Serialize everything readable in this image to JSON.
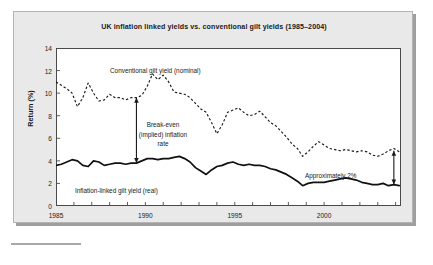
{
  "figure": {
    "title": "UK inflation linked yields vs. conventional gilt yields (1985–2004)",
    "ylabel": "Return (%)",
    "annotations": {
      "nominal": "Conventional gilt yield (nominal)",
      "real": "Inflation-linked gilt yield (real)",
      "breakeven_line1": "Break-even",
      "breakeven_line2": "(implied) inflation",
      "breakeven_line3": "rate",
      "approx": "Approximately 2%"
    }
  },
  "chart_data": {
    "type": "line",
    "title": "UK inflation linked yields vs. conventional gilt yields (1985–2004)",
    "xlabel": "",
    "ylabel": "Return (%)",
    "xlim": [
      1985,
      2004.3
    ],
    "ylim": [
      0,
      14
    ],
    "yticks": [
      0,
      2,
      4,
      6,
      8,
      10,
      12,
      14
    ],
    "xticks_labeled": [
      1985,
      1990,
      1995,
      2000
    ],
    "xtick_step_minor": 1,
    "grid": false,
    "legend_position": "inline-annotations",
    "series": [
      {
        "name": "Conventional gilt yield (nominal)",
        "style": "dashed",
        "color": "#1a1a1a",
        "x": [
          1985.0,
          1985.3,
          1985.6,
          1985.9,
          1986.2,
          1986.5,
          1986.8,
          1987.1,
          1987.4,
          1987.7,
          1988.0,
          1988.3,
          1988.6,
          1988.9,
          1989.2,
          1989.5,
          1989.8,
          1990.1,
          1990.4,
          1990.7,
          1991.0,
          1991.3,
          1991.6,
          1991.9,
          1992.2,
          1992.5,
          1992.8,
          1993.1,
          1993.4,
          1993.7,
          1994.0,
          1994.3,
          1994.6,
          1994.9,
          1995.2,
          1995.5,
          1995.8,
          1996.1,
          1996.4,
          1996.7,
          1997.0,
          1997.3,
          1997.6,
          1997.9,
          1998.2,
          1998.5,
          1998.8,
          1999.1,
          1999.4,
          1999.7,
          2000.0,
          2000.3,
          2000.6,
          2000.9,
          2001.2,
          2001.5,
          2001.8,
          2002.1,
          2002.4,
          2002.7,
          2003.0,
          2003.3,
          2003.6,
          2003.9,
          2004.2
        ],
        "y": [
          11.0,
          10.7,
          10.4,
          10.0,
          8.8,
          9.6,
          10.9,
          10.0,
          9.3,
          9.4,
          9.9,
          9.6,
          9.6,
          9.4,
          9.6,
          9.6,
          9.8,
          10.6,
          11.7,
          11.2,
          11.6,
          11.0,
          10.1,
          10.0,
          9.9,
          9.6,
          9.1,
          8.6,
          8.3,
          7.4,
          6.4,
          7.2,
          8.3,
          8.5,
          8.7,
          8.3,
          8.0,
          8.1,
          8.4,
          7.9,
          7.4,
          7.1,
          6.6,
          6.1,
          5.5,
          5.1,
          4.4,
          4.8,
          5.3,
          5.7,
          5.4,
          5.1,
          5.0,
          4.9,
          5.0,
          4.9,
          4.8,
          4.9,
          4.8,
          4.5,
          4.4,
          4.6,
          4.9,
          5.1,
          4.8
        ]
      },
      {
        "name": "Inflation-linked gilt yield (real)",
        "style": "solid",
        "color": "#1a1a1a",
        "x": [
          1985.0,
          1985.3,
          1985.6,
          1985.9,
          1986.2,
          1986.5,
          1986.8,
          1987.1,
          1987.4,
          1987.7,
          1988.0,
          1988.3,
          1988.6,
          1988.9,
          1989.2,
          1989.5,
          1989.8,
          1990.1,
          1990.4,
          1990.7,
          1991.0,
          1991.3,
          1991.6,
          1991.9,
          1992.2,
          1992.5,
          1992.8,
          1993.1,
          1993.4,
          1993.7,
          1994.0,
          1994.3,
          1994.6,
          1994.9,
          1995.2,
          1995.5,
          1995.8,
          1996.1,
          1996.4,
          1996.7,
          1997.0,
          1997.3,
          1997.6,
          1997.9,
          1998.2,
          1998.5,
          1998.8,
          1999.1,
          1999.4,
          1999.7,
          2000.0,
          2000.3,
          2000.6,
          2000.9,
          2001.2,
          2001.5,
          2001.8,
          2002.1,
          2002.4,
          2002.7,
          2003.0,
          2003.3,
          2003.6,
          2003.9,
          2004.2
        ],
        "y": [
          3.6,
          3.7,
          3.9,
          4.1,
          4.0,
          3.6,
          3.5,
          4.0,
          3.9,
          3.6,
          3.7,
          3.8,
          3.8,
          3.7,
          3.8,
          3.8,
          4.0,
          4.2,
          4.2,
          4.1,
          4.2,
          4.2,
          4.3,
          4.4,
          4.2,
          3.9,
          3.4,
          3.1,
          2.8,
          3.2,
          3.5,
          3.6,
          3.8,
          3.9,
          3.7,
          3.6,
          3.7,
          3.6,
          3.6,
          3.5,
          3.3,
          3.2,
          3.0,
          2.8,
          2.5,
          2.2,
          1.8,
          2.0,
          2.1,
          2.1,
          2.1,
          2.2,
          2.3,
          2.4,
          2.5,
          2.4,
          2.3,
          2.1,
          2.0,
          1.9,
          1.9,
          2.0,
          1.8,
          1.9,
          1.8
        ]
      }
    ],
    "annotations": [
      {
        "text": "Conventional gilt yield (nominal)",
        "x": 1990.0,
        "y": 12.6
      },
      {
        "text": "Inflation-linked gilt yield (real)",
        "x": 1988.0,
        "y": 1.7
      },
      {
        "text": "Break-even (implied) inflation rate",
        "x": 1991.0,
        "y": 6.0,
        "arrow": {
          "x": 1989.5,
          "y_top": 9.6,
          "y_bottom": 3.8,
          "double_headed": true
        }
      },
      {
        "text": "Approximately 2%",
        "x": 2001.8,
        "y": 2.9,
        "arrow": {
          "x": 2003.9,
          "y_top": 4.9,
          "y_bottom": 1.9,
          "double_headed": true
        }
      }
    ]
  }
}
